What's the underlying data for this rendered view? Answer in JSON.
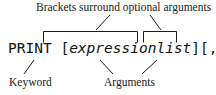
{
  "figure": {
    "type": "syntax-diagram",
    "background_color": "#ffffff",
    "ink_color": "#1a1a1a"
  },
  "captions": {
    "top": "Brackets surround optional arguments",
    "bottom_left": "Keyword",
    "bottom_right": "Arguments"
  },
  "code": {
    "full_text": "PRINT [expressionlist][,;]",
    "keyword": "PRINT",
    "space": " ",
    "open_bracket_1": "[",
    "argument": "expressionlist",
    "close_bracket_1": "]",
    "open_bracket_2": "[",
    "separators": ",;",
    "close_bracket_2": "]"
  },
  "annotations": {
    "top_bracket_1": "ceiling-bracket-over-optional-expressionlist",
    "top_bracket_2": "ceiling-bracket-over-optional-separators",
    "leader_top_left": "leader-from-bracket1-to-top-caption",
    "leader_top_right": "leader-from-bracket2-to-top-caption",
    "leader_keyword": "leader-from-keyword-to-keyword-label",
    "leader_arguments_left": "leader-from-expressionlist-to-arguments-label",
    "leader_arguments_right": "leader-from-separators-to-arguments-label"
  }
}
